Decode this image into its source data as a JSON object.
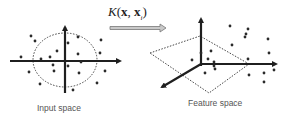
{
  "diagram": {
    "kernel_label": {
      "func": "K",
      "open": "(",
      "arg1": "x",
      "comma": ", ",
      "arg2": "x",
      "subscript": "i",
      "close": ")"
    },
    "colors": {
      "axis": "#1f1f1f",
      "dot": "#2a2a2a",
      "dotted": "#444444",
      "arrow_fill": "#c9c9c9",
      "arrow_stroke": "#777777",
      "caption": "#555555"
    },
    "panels": {
      "input": {
        "caption": "Input space",
        "boundary": "dotted ellipse",
        "point_count": 21
      },
      "feature": {
        "caption": "Feature space",
        "boundary": "dotted plane (diamond)",
        "point_count": 20
      }
    },
    "icons": {
      "map_arrow": "right-arrow-icon"
    }
  }
}
